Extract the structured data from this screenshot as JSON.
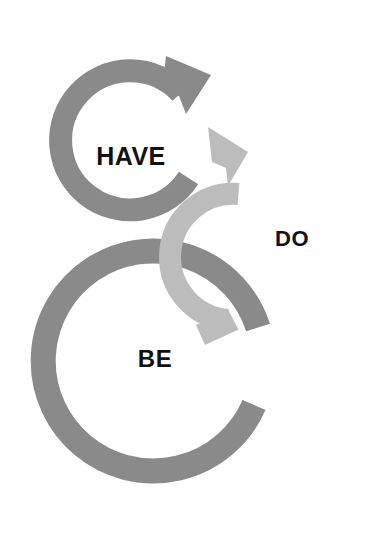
{
  "diagram": {
    "background_color": "#ffffff",
    "rings": [
      {
        "id": "have",
        "label": "HAVE",
        "color": "#8a8a8a",
        "label_color": "#111111",
        "arrow_direction": "clockwise",
        "arrowhead_position": "top-right",
        "center": {
          "x": 122,
          "y": 139
        },
        "outer_radius": 81,
        "stroke_width": 23
      },
      {
        "id": "do",
        "label": "DO",
        "color": "#bcbcbc",
        "label_color": "#111111",
        "arrow_direction": "counter-clockwise",
        "arrowhead_position": "top-left",
        "center": {
          "x": 272,
          "y": 238
        },
        "outer_radius": 66,
        "stroke_width": 22
      },
      {
        "id": "be",
        "label": "BE",
        "color": "#8a8a8a",
        "label_color": "#111111",
        "arrow_direction": "clockwise",
        "arrowhead_position": "none",
        "center": {
          "x": 150,
          "y": 372
        },
        "outer_radius": 122,
        "stroke_width": 25
      }
    ]
  }
}
